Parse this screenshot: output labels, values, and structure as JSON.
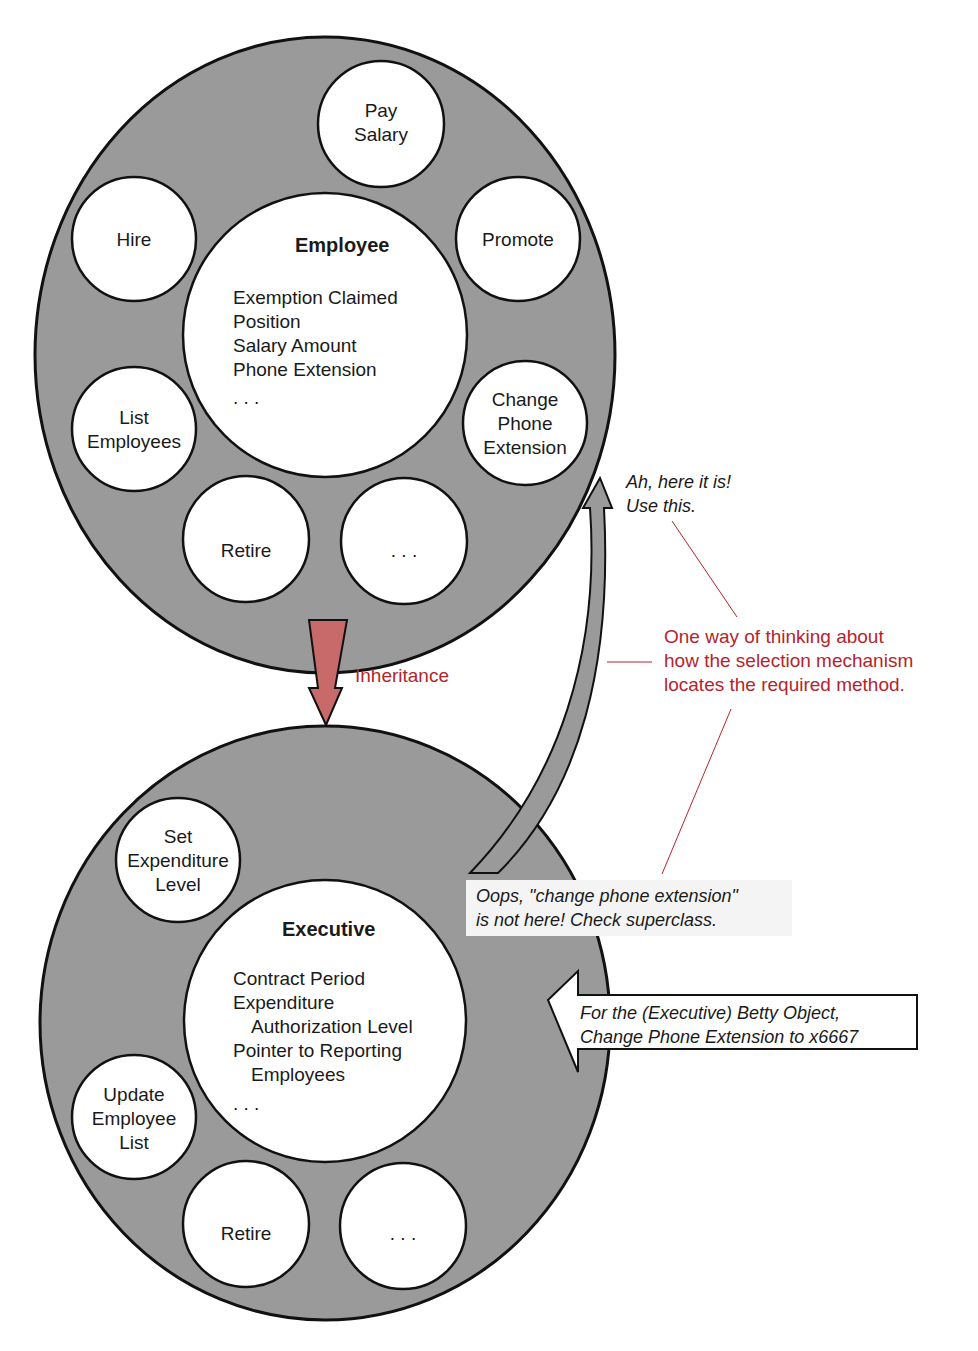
{
  "colors": {
    "object_ring": "#9a9a9a",
    "circle_fill": "#ffffff",
    "outline": "#111111",
    "inheritance_arrow": "#c86a6a",
    "annotation_red": "#b5242c",
    "note_box": "#f4f4f4"
  },
  "employee": {
    "title": "Employee",
    "attributes": [
      "Exemption Claimed",
      "Position",
      "Salary Amount",
      "Phone Extension",
      ". . ."
    ],
    "methods": {
      "pay_salary": [
        "Pay",
        "Salary"
      ],
      "hire": [
        "Hire"
      ],
      "promote": [
        "Promote"
      ],
      "list_employees": [
        "List",
        "Employees"
      ],
      "change_phone_extension": [
        "Change",
        "Phone",
        "Extension"
      ],
      "retire": [
        "Retire"
      ],
      "more": [
        ". . ."
      ]
    }
  },
  "executive": {
    "title": "Executive",
    "attributes": [
      "Contract Period",
      "Expenditure",
      "Authorization Level",
      "Pointer to Reporting",
      "Employees",
      ". . ."
    ],
    "methods": {
      "set_expenditure_level": [
        "Set",
        "Expenditure",
        "Level"
      ],
      "update_employee_list": [
        "Update",
        "Employee",
        "List"
      ],
      "retire": [
        "Retire"
      ],
      "more": [
        ". . ."
      ]
    }
  },
  "labels": {
    "inheritance": "Inheritance",
    "found_note": [
      "Ah, here it is!",
      "Use this."
    ],
    "explanation": [
      "One way of thinking about",
      "how the selection mechanism",
      "locates the required method."
    ],
    "not_here_note": [
      "Oops, \"change phone extension\"",
      "is not here!  Check superclass."
    ],
    "message": [
      "For the (Executive) Betty Object,",
      "Change Phone Extension to x6667"
    ]
  }
}
